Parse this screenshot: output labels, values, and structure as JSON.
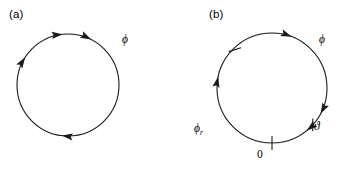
{
  "figure": {
    "width": 347,
    "height": 171,
    "background": "#ffffff",
    "stroke_color": "#1a1a1a",
    "type": "phase-circle-diagram"
  },
  "panels": [
    {
      "id": "a",
      "label": "(a)",
      "circle": {
        "cx": 68,
        "cy": 85,
        "r": 51
      },
      "axis_label": "ϕ",
      "axis_label_name": "phi",
      "arrowheads": [
        {
          "name": "arrowhead-a-1",
          "angle_deg": 213,
          "direction": "clockwise"
        },
        {
          "name": "arrowhead-a-2",
          "angle_deg": 264,
          "direction": "clockwise"
        },
        {
          "name": "arrowhead-a-3",
          "angle_deg": 297,
          "direction": "clockwise"
        },
        {
          "name": "arrowhead-a-4",
          "angle_deg": 97,
          "direction": "clockwise"
        }
      ],
      "ticks": [],
      "tick_labels": []
    },
    {
      "id": "b",
      "label": "(b)",
      "circle": {
        "cx": 98,
        "cy": 88,
        "r": 55
      },
      "axis_label": "ϕ",
      "axis_label_name": "phi",
      "arrowheads": [
        {
          "name": "arrowhead-b-1",
          "angle_deg": 291,
          "direction": "clockwise"
        },
        {
          "name": "arrowhead-b-2",
          "angle_deg": 192,
          "direction": "clockwise"
        },
        {
          "name": "arrowhead-b-3",
          "angle_deg": 28,
          "direction": "clockwise"
        },
        {
          "name": "arrowhead-b-4",
          "angle_deg": 51,
          "direction": "clockwise"
        }
      ],
      "ticks": [
        {
          "name": "tick-phi-r",
          "angle_deg": 216
        },
        {
          "name": "tick-theta",
          "angle_deg": 324
        },
        {
          "name": "tick-zero",
          "angle_deg": 90
        }
      ],
      "tick_labels": [
        {
          "name": "label-phi-r",
          "text": "ϕ",
          "sub": "r"
        },
        {
          "name": "label-theta",
          "text": "ϑ",
          "sub": ""
        },
        {
          "name": "label-zero",
          "text": "0",
          "sub": ""
        }
      ]
    }
  ],
  "labels": {
    "panel_a": "(a)",
    "panel_b": "(b)",
    "phi_a": "ϕ",
    "phi_b": "ϕ",
    "phi_r_symbol": "ϕ",
    "phi_r_subscript": "r",
    "theta": "ϑ",
    "zero": "0"
  }
}
